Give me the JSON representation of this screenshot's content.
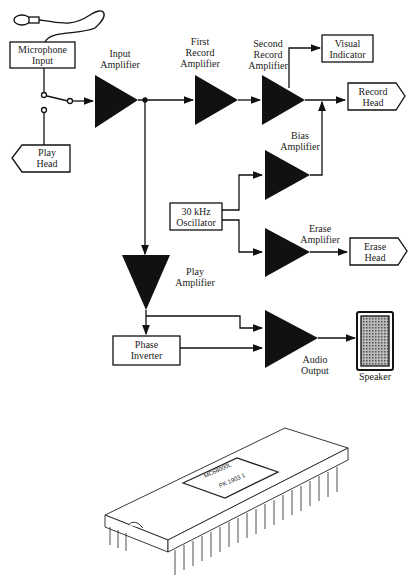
{
  "diagram": {
    "title": "",
    "blocks": {
      "microphone_input": "Microphone\nInput",
      "input_amplifier": "Input\nAmplifier",
      "first_record_amplifier": "First\nRecord\nAmplifier",
      "second_record_amplifier": "Second\nRecord\nAmplifier",
      "visual_indicator": "Visual\nIndicator",
      "record_head": "Record\nHead",
      "play_head": "Play\nHead",
      "bias_amplifier": "Bias\nAmplifier",
      "oscillator": "30 kHz\nOscillator",
      "erase_amplifier": "Erase\nAmplifier",
      "erase_head": "Erase\nHead",
      "play_amplifier": "Play\nAmplifier",
      "phase_inverter": "Phase\nInverter",
      "audio_output": "Audio\nOutput",
      "speaker": "Speaker"
    },
    "chip": {
      "marking_line1": "MC68000L",
      "marking_line2": "PK 1903 1"
    }
  }
}
